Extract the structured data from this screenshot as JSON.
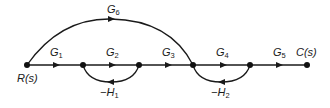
{
  "diagram": {
    "type": "signal-flow-graph",
    "input_label": "R(s)",
    "output_label": "C(s)",
    "nodes": [
      {
        "id": "n1",
        "label": "R(s)"
      },
      {
        "id": "n2"
      },
      {
        "id": "n3"
      },
      {
        "id": "n4"
      },
      {
        "id": "n5"
      },
      {
        "id": "n6",
        "label": "C(s)"
      }
    ],
    "forward_gains": [
      {
        "from": "n1",
        "to": "n2",
        "base": "G",
        "sub": "1"
      },
      {
        "from": "n2",
        "to": "n3",
        "base": "G",
        "sub": "2"
      },
      {
        "from": "n3",
        "to": "n4",
        "base": "G",
        "sub": "3"
      },
      {
        "from": "n4",
        "to": "n5",
        "base": "G",
        "sub": "4"
      },
      {
        "from": "n5",
        "to": "n6",
        "base": "G",
        "sub": "5"
      }
    ],
    "feedforward_gain": {
      "from": "n1",
      "to": "n4",
      "base": "G",
      "sub": "6"
    },
    "feedback_gains": [
      {
        "from": "n3",
        "to": "n2",
        "base": "−H",
        "sub": "1"
      },
      {
        "from": "n5",
        "to": "n4",
        "base": "−H",
        "sub": "2"
      }
    ]
  }
}
